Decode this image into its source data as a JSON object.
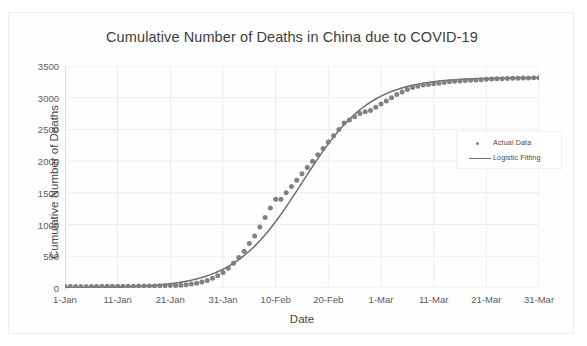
{
  "chart_data": {
    "type": "line",
    "title": "Cumulative Number of Deaths in China due to COVID-19",
    "xlabel": "Date",
    "ylabel": "Cumulative Number of Deaths",
    "ylim": [
      0,
      3500
    ],
    "ytick_labels": [
      "0",
      "500",
      "1000",
      "1500",
      "2000",
      "2500",
      "3000",
      "3500"
    ],
    "ytick_values": [
      0,
      500,
      1000,
      1500,
      2000,
      2500,
      3000,
      3500
    ],
    "xtick_labels": [
      "1-Jan",
      "11-Jan",
      "21-Jan",
      "31-Jan",
      "10-Feb",
      "20-Feb",
      "1-Mar",
      "11-Mar",
      "21-Mar",
      "31-Mar"
    ],
    "xtick_days": [
      0,
      10,
      20,
      30,
      40,
      50,
      60,
      70,
      80,
      90
    ],
    "xlim_days": [
      0,
      90
    ],
    "grid": true,
    "legend_position": "right-middle",
    "series": [
      {
        "name": "Actual Data",
        "style": "scatter",
        "color": "#7b7b7b",
        "x_days": [
          0,
          1,
          2,
          3,
          4,
          5,
          6,
          7,
          8,
          9,
          10,
          11,
          12,
          13,
          14,
          15,
          16,
          17,
          18,
          19,
          20,
          21,
          22,
          23,
          24,
          25,
          26,
          27,
          28,
          29,
          30,
          31,
          32,
          33,
          34,
          35,
          36,
          37,
          38,
          39,
          40,
          41,
          42,
          43,
          44,
          45,
          46,
          47,
          48,
          49,
          50,
          51,
          52,
          53,
          54,
          55,
          56,
          57,
          58,
          59,
          60,
          61,
          62,
          63,
          64,
          65,
          66,
          67,
          68,
          69,
          70,
          71,
          72,
          73,
          74,
          75,
          76,
          77,
          78,
          79,
          80,
          81,
          82,
          83,
          84,
          85,
          86,
          87,
          88,
          89,
          90
        ],
        "values": [
          25,
          24,
          24,
          24,
          24,
          25,
          25,
          26,
          26,
          27,
          27,
          28,
          28,
          29,
          30,
          31,
          32,
          33,
          34,
          36,
          38,
          41,
          45,
          52,
          62,
          76,
          95,
          120,
          152,
          193,
          245,
          310,
          390,
          480,
          580,
          700,
          820,
          960,
          1110,
          1260,
          1400,
          1400,
          1500,
          1600,
          1700,
          1800,
          1900,
          2000,
          2100,
          2200,
          2300,
          2400,
          2500,
          2600,
          2650,
          2700,
          2750,
          2780,
          2800,
          2850,
          2900,
          2950,
          3000,
          3050,
          3090,
          3130,
          3160,
          3180,
          3200,
          3210,
          3220,
          3230,
          3240,
          3250,
          3260,
          3265,
          3270,
          3275,
          3280,
          3285,
          3290,
          3295,
          3298,
          3300,
          3303,
          3306,
          3308,
          3310,
          3312,
          3314,
          3316,
          3318,
          3320
        ]
      },
      {
        "name": "Logistic Fitting",
        "style": "line",
        "color": "#6e6e6e",
        "model": "logistic",
        "L": 3320,
        "k": 0.155,
        "x0_days": 45,
        "x_days": [
          0,
          90
        ]
      }
    ]
  },
  "legend": {
    "items": [
      {
        "label": "Actual Data",
        "marker": "dot"
      },
      {
        "label": "Logistic Fitting",
        "marker": "line"
      }
    ]
  },
  "colors": {
    "marker": "#7b7b7b",
    "fit_line": "#6e6e6e",
    "grid": "#ededed",
    "axis": "#c9c9c9",
    "text": "#4a4a4a"
  }
}
